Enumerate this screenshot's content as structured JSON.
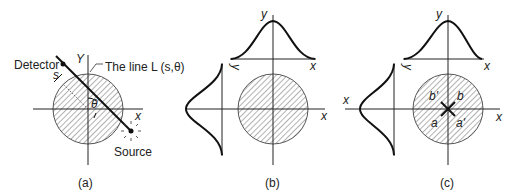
{
  "figure": {
    "panels": [
      {
        "id": "a",
        "caption": "(a)",
        "labels": {
          "detector": "Detector",
          "y_axis": "Y",
          "x_axis": "x",
          "line": "The line L (s,θ)",
          "s": "s",
          "theta": "θ",
          "source": "Source"
        }
      },
      {
        "id": "b",
        "caption": "(b)",
        "labels": {
          "y_axis": "y",
          "x_axis": "x",
          "top_proj_x": "x",
          "left_proj_y": "y",
          "left_proj_x": "x"
        }
      },
      {
        "id": "c",
        "caption": "(c)",
        "labels": {
          "y_axis": "y",
          "x_axis": "x",
          "top_proj_x": "x",
          "left_proj_y": "y",
          "left_proj_x": "x",
          "quad_b_prime": "b'",
          "quad_b": "b",
          "quad_a": "a",
          "quad_a_prime": "a'"
        }
      }
    ]
  }
}
